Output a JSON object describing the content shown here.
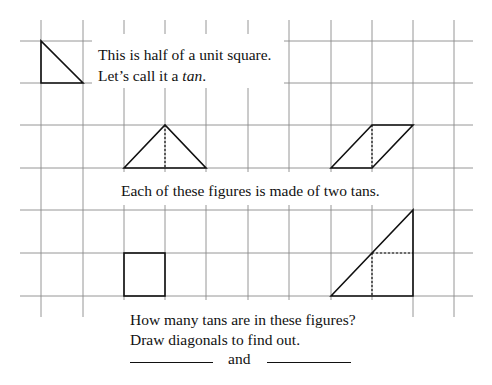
{
  "intro": {
    "line1": "This is half of a unit square.",
    "line2_prefix": "Let’s call it a ",
    "line2_term": "tan",
    "line2_suffix": "."
  },
  "middle": {
    "caption": "Each of these figures is made of two tans."
  },
  "question": {
    "line1": "How many tans are in these figures?",
    "line2": "Draw diagonals to find out.",
    "connector": "and",
    "answer_blanks": [
      "",
      ""
    ]
  },
  "grid": {
    "cell_size": 41.3,
    "vertical_lines_x": [
      41,
      83,
      124,
      165,
      206,
      248,
      289,
      331,
      372,
      413,
      454
    ],
    "horizontal_lines_y": [
      41,
      83,
      125,
      168,
      210,
      253,
      296
    ],
    "line_color": "#8a8a8a"
  },
  "figures": [
    {
      "name": "tan-triangle",
      "description": "half unit square",
      "shape": "right-triangle"
    },
    {
      "name": "isosceles-triangle",
      "description": "two tans",
      "shape": "triangle"
    },
    {
      "name": "parallelogram",
      "description": "two tans",
      "shape": "parallelogram"
    },
    {
      "name": "square",
      "description": "unknown tans",
      "shape": "square"
    },
    {
      "name": "large-triangle",
      "description": "unknown tans",
      "shape": "right-triangle"
    }
  ],
  "colors": {
    "figure_stroke": "#111111",
    "grid": "#8a8a8a",
    "background": "#ffffff"
  }
}
